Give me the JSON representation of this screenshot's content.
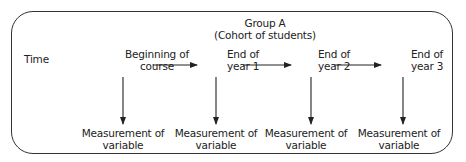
{
  "group": {
    "title": "Group A",
    "subtitle": "(Cohort of students)"
  },
  "axis_label": "Time",
  "stages": [
    {
      "line1": "Beginning of",
      "line2": "course"
    },
    {
      "line1": "End of",
      "line2": "year 1"
    },
    {
      "line1": "End of",
      "line2": "year 2"
    },
    {
      "line1": "End of",
      "line2": "year 3"
    }
  ],
  "measurements": [
    {
      "line1": "Measurement of",
      "line2": "variable"
    },
    {
      "line1": "Measurement of",
      "line2": "variable"
    },
    {
      "line1": "Measurement of",
      "line2": "variable"
    },
    {
      "line1": "Measurement of",
      "line2": "variable"
    }
  ]
}
